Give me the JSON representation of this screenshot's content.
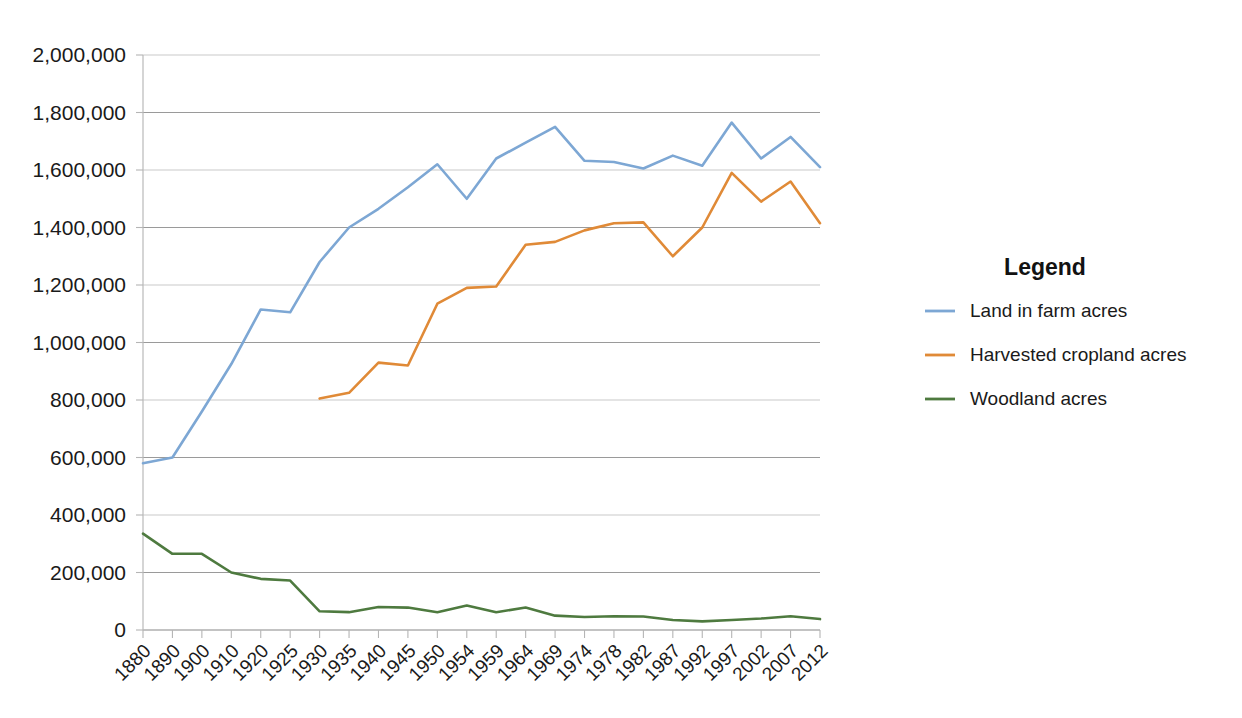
{
  "chart_data": {
    "type": "line",
    "title": "",
    "subtitle": "",
    "xlabel": "",
    "ylabel": "",
    "grid": true,
    "legend_position": "right",
    "legend_title": "Legend",
    "ylim": [
      0,
      2000000
    ],
    "ytick_labels": [
      "0",
      "200,000",
      "400,000",
      "600,000",
      "800,000",
      "1,000,000",
      "1,200,000",
      "1,400,000",
      "1,600,000",
      "1,800,000",
      "2,000,000"
    ],
    "ytick_values": [
      0,
      200000,
      400000,
      600000,
      800000,
      1000000,
      1200000,
      1400000,
      1600000,
      1800000,
      2000000
    ],
    "categories": [
      "1880",
      "1890",
      "1900",
      "1910",
      "1920",
      "1925",
      "1930",
      "1935",
      "1940",
      "1945",
      "1950",
      "1954",
      "1959",
      "1964",
      "1969",
      "1974",
      "1978",
      "1982",
      "1987",
      "1992",
      "1997",
      "2002",
      "2007",
      "2012"
    ],
    "series": [
      {
        "name": "Land in farm acres",
        "color": "#7da7d4",
        "values": [
          580000,
          600000,
          760000,
          925000,
          1115000,
          1105000,
          1280000,
          1400000,
          1465000,
          1540000,
          1620000,
          1500000,
          1640000,
          1695000,
          1750000,
          1632000,
          1628000,
          1605000,
          1650000,
          1615000,
          1765000,
          1640000,
          1715000,
          1610000
        ]
      },
      {
        "name": "Harvested cropland acres",
        "color": "#e08a37",
        "values": [
          null,
          null,
          null,
          null,
          null,
          null,
          805000,
          825000,
          930000,
          920000,
          1135000,
          1190000,
          1195000,
          1340000,
          1350000,
          1390000,
          1415000,
          1418000,
          1300000,
          1400000,
          1590000,
          1490000,
          1560000,
          1415000
        ]
      },
      {
        "name": "Woodland acres",
        "color": "#4e7a3f",
        "values": [
          335000,
          265000,
          265000,
          200000,
          178000,
          172000,
          65000,
          62000,
          80000,
          78000,
          62000,
          85000,
          62000,
          78000,
          50000,
          45000,
          48000,
          47000,
          35000,
          30000,
          35000,
          40000,
          48000,
          38000
        ]
      }
    ]
  },
  "plot_geometry": {
    "left": 143,
    "right": 820,
    "top": 55,
    "bottom": 630
  },
  "legend_geometry": {
    "title_x": 1045,
    "title_y": 275,
    "first_item_y": 317,
    "item_spacing": 44,
    "swatch_x1": 925,
    "swatch_x2": 955,
    "label_x": 970
  }
}
